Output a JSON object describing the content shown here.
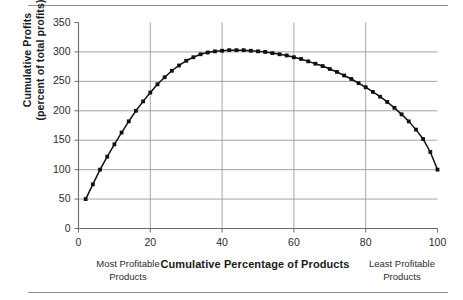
{
  "figure": {
    "rule_top": "",
    "rule_bottom": ""
  },
  "axis": {
    "ylabel_line1": "Cumulative Profits",
    "ylabel_line2": "(percent of total profits)",
    "xlabel": "Cumulative Percentage of Products",
    "note_left_line1": "Most Profitable",
    "note_left_line2": "Products",
    "note_right_line1": "Least Profitable",
    "note_right_line2": "Products"
  },
  "chart_data": {
    "type": "line",
    "title": "",
    "subtitle": "",
    "xlabel": "Cumulative Percentage of Products",
    "ylabel": "Cumulative Profits (percent of total profits)",
    "xlim": [
      0,
      100
    ],
    "ylim": [
      0,
      350
    ],
    "xticks": [
      0,
      20,
      40,
      60,
      80,
      100
    ],
    "yticks": [
      0,
      50,
      100,
      150,
      200,
      250,
      300,
      350
    ],
    "xtick_labels": [
      "0",
      "20",
      "40",
      "60",
      "80",
      "100"
    ],
    "ytick_labels": [
      "0",
      "50",
      "100",
      "150",
      "200",
      "250",
      "300",
      "350"
    ],
    "grid": {
      "horizontal": [
        50,
        100,
        150,
        200,
        250,
        300
      ],
      "vertical": [
        20,
        40,
        60,
        80
      ]
    },
    "legend": null,
    "legend_position": "none",
    "marker": "square",
    "line_color": "#111111",
    "marker_color": "#111111",
    "annotations": [
      {
        "text": "Most Profitable Products",
        "x": 3,
        "position": "below-axis-left"
      },
      {
        "text": "Least Profitable Products",
        "x": 97,
        "position": "below-axis-right"
      }
    ],
    "series": [
      {
        "name": "Cumulative profit",
        "x": [
          2,
          4,
          6,
          8,
          10,
          12,
          14,
          16,
          18,
          20,
          22,
          24,
          26,
          28,
          30,
          32,
          34,
          36,
          38,
          40,
          42,
          44,
          46,
          48,
          50,
          52,
          54,
          56,
          58,
          60,
          62,
          64,
          66,
          68,
          70,
          72,
          74,
          76,
          78,
          80,
          82,
          84,
          86,
          88,
          90,
          92,
          94,
          96,
          98,
          100
        ],
        "values": [
          50,
          75,
          100,
          122,
          143,
          163,
          182,
          200,
          216,
          231,
          245,
          257,
          268,
          277,
          285,
          291,
          296,
          299,
          301,
          302,
          303,
          303,
          303,
          302,
          301,
          300,
          298,
          296,
          294,
          291,
          288,
          284,
          280,
          276,
          271,
          266,
          260,
          254,
          247,
          240,
          232,
          224,
          215,
          205,
          194,
          182,
          168,
          152,
          130,
          100
        ]
      }
    ]
  }
}
